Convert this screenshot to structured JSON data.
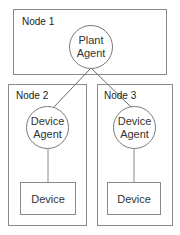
{
  "diagram": {
    "nodes": [
      {
        "label": "Node 1",
        "agent": {
          "line1": "Plant",
          "line2": "Agent"
        }
      },
      {
        "label": "Node 2",
        "agent": {
          "line1": "Device",
          "line2": "Agent"
        },
        "device": "Device"
      },
      {
        "label": "Node 3",
        "agent": {
          "line1": "Device",
          "line2": "Agent"
        },
        "device": "Device"
      }
    ],
    "colors": {
      "border": "#8a8a8a",
      "line": "#6a6a6a",
      "background": "#ffffff"
    }
  }
}
